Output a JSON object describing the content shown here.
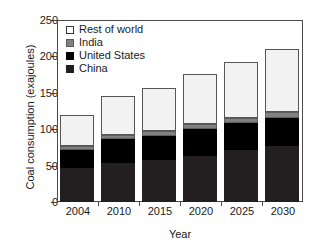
{
  "chart_data": {
    "type": "bar",
    "stacked": true,
    "title": "",
    "xlabel": "Year",
    "ylabel": "Coal consumption (exajoules)",
    "categories": [
      "2004",
      "2010",
      "2015",
      "2020",
      "2025",
      "2030"
    ],
    "ylim": [
      0,
      250
    ],
    "yticks": [
      0,
      50,
      100,
      150,
      200,
      250
    ],
    "grid": false,
    "legend_position": "top-left",
    "series": [
      {
        "name": "China",
        "color": "#231f20",
        "values": [
          47,
          54,
          58,
          63,
          71,
          77
        ]
      },
      {
        "name": "United States",
        "color": "#000000",
        "values": [
          24,
          32,
          33,
          37,
          38,
          39
        ]
      },
      {
        "name": "India",
        "color": "#808080",
        "values": [
          6,
          6,
          6,
          7,
          7,
          8
        ]
      },
      {
        "name": "Rest of world",
        "color": "#f2f2f2",
        "values": [
          43,
          53,
          60,
          69,
          76,
          86
        ]
      }
    ],
    "totals": [
      120,
      145,
      157,
      176,
      192,
      210
    ]
  },
  "legend": {
    "items": [
      {
        "label": "Rest of world",
        "swatch": "rest-of-world-swatch"
      },
      {
        "label": "India",
        "swatch": "india-swatch"
      },
      {
        "label": "United States",
        "swatch": "united-states-swatch"
      },
      {
        "label": "China",
        "swatch": "china-swatch"
      }
    ]
  },
  "axes": {
    "y_title": "Coal consumption (exajoules)",
    "x_title": "Year",
    "y_ticks": [
      "250",
      "200",
      "150",
      "100",
      "50",
      "0"
    ],
    "x_ticks": [
      "2004",
      "2010",
      "2015",
      "2020",
      "2025",
      "2030"
    ]
  }
}
